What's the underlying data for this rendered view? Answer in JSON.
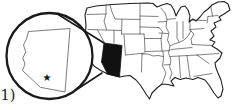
{
  "figure": {
    "label": "1)",
    "map": {
      "region": "contiguous United States",
      "highlighted_state": "Arizona",
      "inset": "magnified Arizona outline",
      "marker_glyph": "★"
    },
    "colors": {
      "background": "#ffffff",
      "map_outline": "#1f1f1f",
      "state_border": "#3d3d3d",
      "highlight_fill": "#111111",
      "magnifier_stroke": "#1a1a1a",
      "inset_outline": "#5a5a5a",
      "marker": "#111111",
      "label_color": "#222222"
    }
  }
}
